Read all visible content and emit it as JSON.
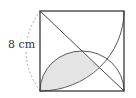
{
  "diagram": {
    "side_label": "8 cm",
    "colors": {
      "line": "#4a4a4a",
      "fill": "#e4e4e4",
      "dashed": "#9a9a9a",
      "background": "#ffffff"
    },
    "shapes": [
      "square",
      "diagonal",
      "semicircle-on-bottom-side",
      "quarter-circle-arc",
      "shaded-region",
      "dashed-dimension-arc"
    ]
  }
}
